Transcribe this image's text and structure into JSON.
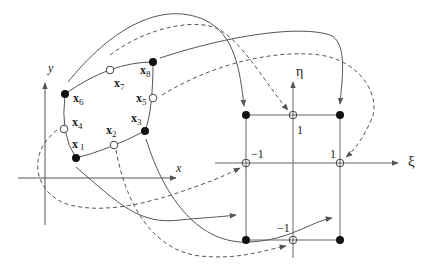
{
  "figure": {
    "colors": {
      "line": "#555555",
      "node": "#111111",
      "background": "#ffffff"
    }
  },
  "physical": {
    "axis_x_label": "x",
    "axis_y_label": "y",
    "nodes": [
      {
        "id": "x1",
        "label": "x",
        "sub": "1",
        "type": "corner"
      },
      {
        "id": "x2",
        "label": "x",
        "sub": "2",
        "type": "midside"
      },
      {
        "id": "x3",
        "label": "x",
        "sub": "3",
        "type": "corner"
      },
      {
        "id": "x4",
        "label": "x",
        "sub": "4",
        "type": "midside"
      },
      {
        "id": "x5",
        "label": "x",
        "sub": "5",
        "type": "midside"
      },
      {
        "id": "x6",
        "label": "x",
        "sub": "6",
        "type": "corner"
      },
      {
        "id": "x7",
        "label": "x",
        "sub": "7",
        "type": "midside"
      },
      {
        "id": "x8",
        "label": "x",
        "sub": "8",
        "type": "corner"
      }
    ]
  },
  "reference": {
    "axis_xi_label": "ξ",
    "axis_eta_label": "η",
    "tick_labels": {
      "eta_pos": "1",
      "eta_neg": "−1",
      "xi_pos": "1",
      "xi_neg": "−1"
    }
  },
  "legend": {
    "solid_arrows": "corner node mappings",
    "dashed_arrows": "midside node mappings"
  }
}
